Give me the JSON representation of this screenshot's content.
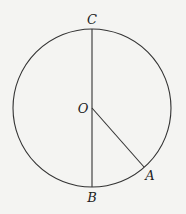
{
  "diagram": {
    "type": "circle-geometry",
    "colors": {
      "stroke": "#333333",
      "background": "#f4f4f2",
      "text": "#222222"
    },
    "circle": {
      "center": "O",
      "cx": 92,
      "cy": 108,
      "r": 79
    },
    "points": {
      "C": {
        "label": "C",
        "x": 92,
        "y": 29,
        "lx": 92,
        "ly": 24
      },
      "O": {
        "label": "O",
        "x": 92,
        "y": 108,
        "lx": 82,
        "ly": 113
      },
      "B": {
        "label": "B",
        "x": 92,
        "y": 187,
        "lx": 92,
        "ly": 202
      },
      "A": {
        "label": "A",
        "x": 144,
        "y": 167,
        "lx": 150,
        "ly": 180
      }
    },
    "segments": [
      {
        "from": "C",
        "to": "B",
        "name": "diameter-CB"
      },
      {
        "from": "O",
        "to": "A",
        "name": "radius-OA"
      }
    ]
  }
}
